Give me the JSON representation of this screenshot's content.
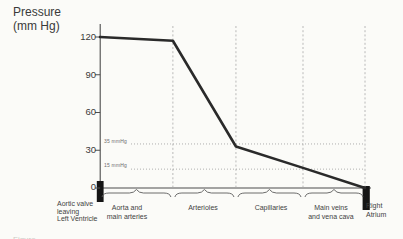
{
  "pressure_axis_title": "Pressure\n(mm Hg)",
  "caption_fragment": "Figure",
  "chart_data": {
    "type": "line",
    "title": "",
    "ylabel": "Pressure (mm Hg)",
    "xlabel": "",
    "ylim": [
      0,
      120
    ],
    "grid": "dashed vertical segment dividers, dotted horizontal reference lines",
    "legend": "none",
    "y_ticks": [
      120,
      90,
      60,
      30,
      0
    ],
    "categories": [
      "Aortic valve leaving Left Ventricle",
      "Aorta and main arteries",
      "Arterioles",
      "Capillaries",
      "Main veins and vena cava",
      "Right Atrium"
    ],
    "series": [
      {
        "name": "blood pressure along systemic circulation",
        "points": [
          {
            "x": 0.0,
            "pressure": 120
          },
          {
            "x": 0.275,
            "pressure": 117
          },
          {
            "x": 0.513,
            "pressure": 33
          },
          {
            "x": 0.766,
            "pressure": 16
          },
          {
            "x": 1.0,
            "pressure": 0
          }
        ]
      }
    ],
    "reference_lines": [
      {
        "pressure": 35,
        "label": "35 mmHg"
      },
      {
        "pressure": 15,
        "label": "15 mmHg"
      }
    ],
    "segment_boundaries_frac": [
      0,
      0.275,
      0.513,
      0.766,
      1
    ],
    "segments": [
      {
        "label": "Aortic valve\nleaving\nLeft Ventricle",
        "type": "point-marker"
      },
      {
        "label": "Aorta and\nmain arteries",
        "type": "braced-span"
      },
      {
        "label": "Arterioles",
        "type": "braced-span"
      },
      {
        "label": "Capillaries",
        "type": "braced-span"
      },
      {
        "label": "Main veins\nand vena cava",
        "type": "braced-span"
      },
      {
        "label": "Right\nAtrium",
        "type": "point-marker"
      }
    ],
    "colors": {
      "curve": "#2a2a2a",
      "axis": "#4d4d4d",
      "divider": "#a8a8a8",
      "marker_bar": "#151515",
      "background": "#fbfbf8"
    }
  }
}
